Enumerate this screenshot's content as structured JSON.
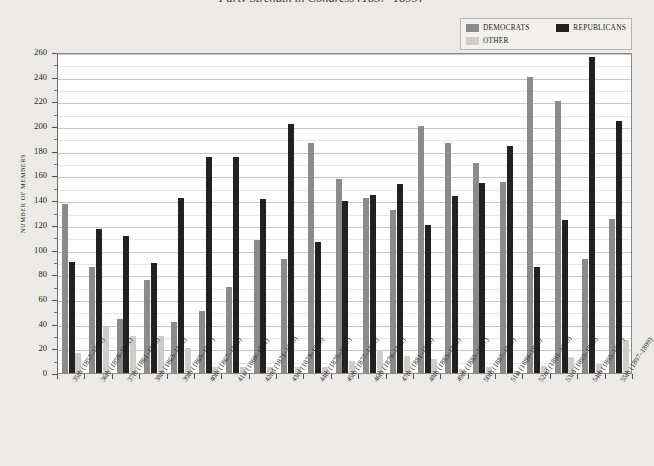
{
  "title": "Party Strength in Congress (1857–1899)",
  "legend": {
    "position": "top-right",
    "items": [
      {
        "label": "DEMOCRATS",
        "color": "#8b8b8b"
      },
      {
        "label": "REPUBLICANS",
        "color": "#222222"
      },
      {
        "label": "OTHER",
        "color": "#cfcdc9"
      }
    ]
  },
  "axes": {
    "ylabel": "NUMBER OF MEMBERS",
    "xlabel": ""
  },
  "chart_data": {
    "type": "bar",
    "title": "Party Strength in Congress (1857–1899)",
    "xlabel": "",
    "ylabel": "NUMBER OF MEMBERS",
    "ylim": [
      0,
      260
    ],
    "ytick_step": 20,
    "yminor_step": 10,
    "grid": true,
    "legend_position": "top-right",
    "yticks": [
      0,
      20,
      40,
      60,
      80,
      100,
      120,
      140,
      160,
      180,
      200,
      220,
      240,
      260
    ],
    "categories": [
      "35th (1857–1859)",
      "36th (1859–1861)",
      "37th (1861–1863)",
      "38th (1863–1865)",
      "39th (1865–1867)",
      "40th (1867–1869)",
      "41st (1869–1871)",
      "42nd (1871–1873)",
      "43rd (1873–1875)",
      "44th (1875–1877)",
      "45th (1877–1879)",
      "46th (1879–1881)",
      "47th (1881–1883)",
      "48th (1883–1885)",
      "49th (1885–1887)",
      "50th (1887–1889)",
      "51st (1889–1891)",
      "52nd (1891–1893)",
      "53rd (1893–1895)",
      "54th (1895–1897)",
      "55th (1897–1899)"
    ],
    "series": [
      {
        "name": "DEMOCRATS",
        "color": "#8b8b8b",
        "values": [
          137,
          86,
          44,
          75,
          41,
          50,
          70,
          108,
          92,
          186,
          157,
          142,
          132,
          200,
          186,
          170,
          155,
          240,
          220,
          92,
          125
        ]
      },
      {
        "name": "REPUBLICANS",
        "color": "#222222",
        "values": [
          90,
          117,
          111,
          89,
          142,
          175,
          175,
          141,
          202,
          106,
          139,
          144,
          153,
          120,
          143,
          154,
          184,
          86,
          124,
          256,
          204
        ]
      },
      {
        "name": "OTHER",
        "color": "#cfcdc9",
        "values": [
          16,
          37,
          30,
          30,
          20,
          5,
          5,
          5,
          5,
          5,
          10,
          19,
          14,
          11,
          3,
          5,
          2,
          6,
          13,
          7,
          27
        ]
      }
    ]
  }
}
